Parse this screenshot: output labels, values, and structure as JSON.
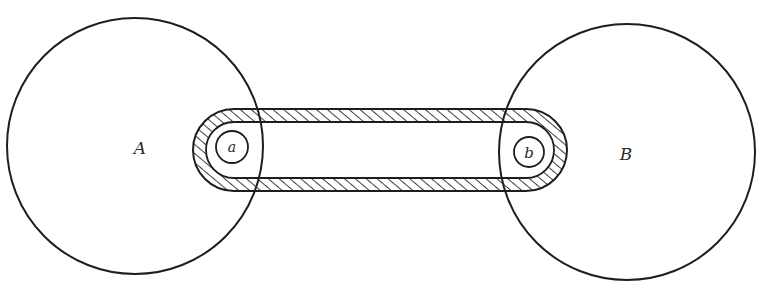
{
  "diagram": {
    "type": "belt-drive-schematic",
    "stroke_color": "#1e1e1e",
    "background": "#ffffff",
    "wheels": [
      {
        "id": "A",
        "label": "A",
        "cx": 135,
        "cy": 146,
        "r": 128
      },
      {
        "id": "B",
        "label": "B",
        "cx": 627,
        "cy": 152,
        "r": 128
      }
    ],
    "pulleys": [
      {
        "id": "a",
        "label": "a",
        "cx": 232,
        "cy": 147,
        "r": 16
      },
      {
        "id": "b",
        "label": "b",
        "cx": 529,
        "cy": 152,
        "r": 15
      }
    ],
    "belt": {
      "description": "hatched closed belt connecting pulley a and pulley b",
      "outer": {
        "x": 193,
        "y": 109,
        "width": 374,
        "height": 82,
        "rx": 41
      },
      "inner": {
        "x": 206,
        "y": 122,
        "width": 348,
        "height": 56,
        "rx": 28
      },
      "hatch": "diagonal"
    }
  }
}
